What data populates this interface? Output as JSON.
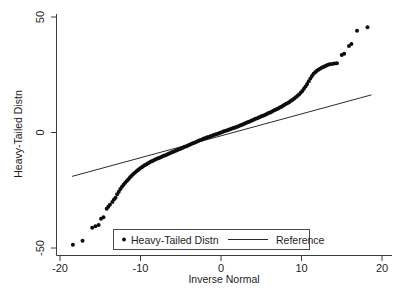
{
  "chart_data": {
    "type": "scatter",
    "title": "",
    "subtitle": "",
    "xlabel": "Inverse Normal",
    "ylabel": "Heavy-Tailed Distn",
    "xlim": [
      -20,
      20
    ],
    "ylim": [
      -50,
      50
    ],
    "xticks": [
      -20,
      -10,
      0,
      10,
      20
    ],
    "xtick_labels": [
      "-20",
      "-10",
      "0",
      "10",
      "20"
    ],
    "yticks": [
      -50,
      0,
      50
    ],
    "ytick_labels": [
      "-50",
      "0",
      "50"
    ],
    "grid": false,
    "legend_position": "bottom-center",
    "legend": [
      {
        "label": "Heavy-Tailed Distn",
        "marker": "dot",
        "color": "#0d0d0d"
      },
      {
        "label": "Reference",
        "marker": "line",
        "color": "#2b2b2b"
      }
    ],
    "series": [
      {
        "name": "Heavy-Tailed Distn",
        "type": "scatter",
        "marker": "dot",
        "color": "#0d0d0d",
        "points": [
          [
            -18.4,
            -48.6
          ],
          [
            -17.2,
            -46.9
          ],
          [
            -16.0,
            -41.2
          ],
          [
            -15.6,
            -40.6
          ],
          [
            -15.2,
            -40.0
          ],
          [
            -14.9,
            -37.3
          ],
          [
            -14.6,
            -36.7
          ],
          [
            -14.2,
            -33.0
          ],
          [
            -14.0,
            -32.1
          ],
          [
            -13.8,
            -31.3
          ],
          [
            -13.5,
            -30.1
          ],
          [
            -13.3,
            -29.0
          ],
          [
            -13.1,
            -28.2
          ],
          [
            -12.9,
            -26.7
          ],
          [
            -12.7,
            -25.6
          ],
          [
            -12.5,
            -24.5
          ],
          [
            -12.3,
            -23.5
          ],
          [
            -12.1,
            -22.6
          ],
          [
            -11.9,
            -21.8
          ],
          [
            -11.7,
            -21.0
          ],
          [
            -11.5,
            -20.2
          ],
          [
            -11.3,
            -19.4
          ],
          [
            -11.1,
            -18.7
          ],
          [
            -10.9,
            -18.0
          ],
          [
            -10.7,
            -17.4
          ],
          [
            -10.5,
            -16.8
          ],
          [
            -10.3,
            -16.2
          ],
          [
            -10.1,
            -15.7
          ],
          [
            -9.9,
            -15.2
          ],
          [
            -9.7,
            -14.7
          ],
          [
            -9.5,
            -14.2
          ],
          [
            -9.3,
            -13.8
          ],
          [
            -9.1,
            -13.4
          ],
          [
            -8.9,
            -13.0
          ],
          [
            -8.7,
            -12.6
          ],
          [
            -8.5,
            -12.3
          ],
          [
            -8.3,
            -11.9
          ],
          [
            -8.1,
            -11.6
          ],
          [
            -7.9,
            -11.3
          ],
          [
            -7.7,
            -11.0
          ],
          [
            -7.5,
            -10.7
          ],
          [
            -7.3,
            -10.4
          ],
          [
            -7.1,
            -10.1
          ],
          [
            -6.9,
            -9.8
          ],
          [
            -6.7,
            -9.5
          ],
          [
            -6.5,
            -9.2
          ],
          [
            -6.3,
            -8.9
          ],
          [
            -6.1,
            -8.6
          ],
          [
            -5.9,
            -8.3
          ],
          [
            -5.7,
            -8.0
          ],
          [
            -5.5,
            -7.7
          ],
          [
            -5.3,
            -7.4
          ],
          [
            -5.1,
            -7.1
          ],
          [
            -4.9,
            -6.8
          ],
          [
            -4.7,
            -6.5
          ],
          [
            -4.5,
            -6.2
          ],
          [
            -4.3,
            -5.9
          ],
          [
            -4.1,
            -5.6
          ],
          [
            -3.9,
            -5.3
          ],
          [
            -3.7,
            -5.0
          ],
          [
            -3.5,
            -4.7
          ],
          [
            -3.3,
            -4.4
          ],
          [
            -3.1,
            -4.1
          ],
          [
            -2.9,
            -3.8
          ],
          [
            -2.7,
            -3.5
          ],
          [
            -2.5,
            -3.2
          ],
          [
            -2.3,
            -2.9
          ],
          [
            -2.1,
            -2.6
          ],
          [
            -1.9,
            -2.4
          ],
          [
            -1.7,
            -2.1
          ],
          [
            -1.5,
            -1.9
          ],
          [
            -1.3,
            -1.6
          ],
          [
            -1.1,
            -1.4
          ],
          [
            -0.9,
            -1.1
          ],
          [
            -0.7,
            -0.9
          ],
          [
            -0.5,
            -0.6
          ],
          [
            -0.3,
            -0.4
          ],
          [
            -0.1,
            -0.1
          ],
          [
            0.1,
            0.1
          ],
          [
            0.3,
            0.4
          ],
          [
            0.5,
            0.6
          ],
          [
            0.7,
            0.9
          ],
          [
            0.9,
            1.1
          ],
          [
            1.1,
            1.4
          ],
          [
            1.3,
            1.6
          ],
          [
            1.5,
            1.9
          ],
          [
            1.7,
            2.1
          ],
          [
            1.9,
            2.4
          ],
          [
            2.1,
            2.6
          ],
          [
            2.3,
            2.9
          ],
          [
            2.5,
            3.2
          ],
          [
            2.7,
            3.5
          ],
          [
            2.9,
            3.8
          ],
          [
            3.1,
            4.1
          ],
          [
            3.3,
            4.4
          ],
          [
            3.5,
            4.7
          ],
          [
            3.7,
            5.0
          ],
          [
            3.9,
            5.3
          ],
          [
            4.1,
            5.6
          ],
          [
            4.3,
            5.9
          ],
          [
            4.5,
            6.2
          ],
          [
            4.7,
            6.5
          ],
          [
            4.9,
            6.8
          ],
          [
            5.1,
            7.1
          ],
          [
            5.3,
            7.4
          ],
          [
            5.5,
            7.7
          ],
          [
            5.7,
            8.0
          ],
          [
            5.9,
            8.4
          ],
          [
            6.1,
            8.7
          ],
          [
            6.3,
            9.0
          ],
          [
            6.5,
            9.4
          ],
          [
            6.7,
            9.7
          ],
          [
            6.9,
            10.1
          ],
          [
            7.1,
            10.4
          ],
          [
            7.3,
            10.8
          ],
          [
            7.5,
            11.2
          ],
          [
            7.7,
            11.6
          ],
          [
            7.9,
            12.0
          ],
          [
            8.1,
            12.4
          ],
          [
            8.3,
            12.8
          ],
          [
            8.5,
            13.2
          ],
          [
            8.7,
            13.7
          ],
          [
            8.9,
            14.2
          ],
          [
            9.1,
            14.7
          ],
          [
            9.3,
            15.3
          ],
          [
            9.5,
            15.9
          ],
          [
            9.7,
            16.5
          ],
          [
            9.9,
            17.2
          ],
          [
            10.1,
            18.0
          ],
          [
            10.3,
            18.9
          ],
          [
            10.5,
            19.9
          ],
          [
            10.7,
            21.0
          ],
          [
            10.9,
            22.2
          ],
          [
            11.1,
            23.4
          ],
          [
            11.3,
            24.5
          ],
          [
            11.5,
            25.4
          ],
          [
            11.7,
            26.1
          ],
          [
            11.9,
            26.7
          ],
          [
            12.1,
            27.2
          ],
          [
            12.3,
            27.6
          ],
          [
            12.5,
            28.0
          ],
          [
            12.7,
            28.4
          ],
          [
            12.9,
            28.7
          ],
          [
            13.1,
            29.0
          ],
          [
            13.3,
            29.3
          ],
          [
            13.5,
            29.5
          ],
          [
            13.8,
            29.7
          ],
          [
            14.1,
            29.9
          ],
          [
            14.4,
            30.0
          ],
          [
            15.0,
            33.5
          ],
          [
            15.3,
            34.1
          ],
          [
            15.9,
            37.5
          ],
          [
            16.2,
            38.3
          ],
          [
            16.9,
            44.0
          ],
          [
            18.2,
            45.6
          ]
        ]
      },
      {
        "name": "Reference",
        "type": "line",
        "color": "#2b2b2b",
        "endpoints": [
          [
            -18.5,
            -19.0
          ],
          [
            18.7,
            16.3
          ]
        ]
      }
    ]
  }
}
